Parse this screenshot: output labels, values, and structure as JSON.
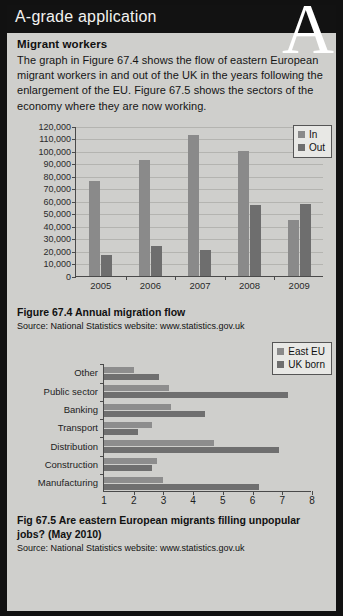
{
  "header": {
    "title": "A-grade application",
    "watermark": "A"
  },
  "article": {
    "subheading": "Migrant workers",
    "paragraph": "The graph in Figure 67.4 shows the flow of eastern European migrant workers in and out of the UK in the years following the enlargement of the EU. Figure 67.5 shows the sectors of the economy where they are now working."
  },
  "figure1": {
    "caption": "Figure 67.4  Annual migration flow",
    "source": "Source: National Statistics website: www.statistics.gov.uk"
  },
  "figure2": {
    "caption": "Fig 67.5  Are eastern European migrants filling unpopular jobs? (May 2010)",
    "source": "Source: National Statistics website: www.statistics.gov.uk"
  },
  "colors": {
    "series1": "#8a8a8a",
    "series2": "#6e6e6e",
    "page_bg": "#cfcfcc",
    "header_bg": "#121212",
    "axis": "#4a4a4a"
  },
  "chart_data": [
    {
      "type": "bar",
      "title": "Annual migration flow",
      "orientation": "vertical",
      "categories": [
        "2005",
        "2006",
        "2007",
        "2008",
        "2009"
      ],
      "series": [
        {
          "name": "In",
          "values": [
            76000,
            93000,
            113000,
            100000,
            45000
          ]
        },
        {
          "name": "Out",
          "values": [
            17000,
            24000,
            20500,
            57000,
            57500
          ]
        }
      ],
      "xlabel": "",
      "ylabel": "",
      "ylim": [
        0,
        120000
      ],
      "yticks": [
        0,
        10000,
        20000,
        30000,
        40000,
        50000,
        60000,
        70000,
        80000,
        90000,
        100000,
        110000,
        120000
      ],
      "ytick_labels": [
        "0",
        "10,000",
        "20,000",
        "30,000",
        "40,000",
        "50,000",
        "60,000",
        "70,000",
        "80,000",
        "90,000",
        "100,000",
        "110,000",
        "120,000"
      ],
      "grid": true,
      "legend_position": "top-right"
    },
    {
      "type": "bar",
      "title": "Are eastern European migrants filling unpopular jobs? (May 2010)",
      "orientation": "horizontal",
      "categories": [
        "Other",
        "Public sector",
        "Banking",
        "Transport",
        "Distribution",
        "Construction",
        "Manufacturing"
      ],
      "series": [
        {
          "name": "East EU",
          "values": [
            2.0,
            3.2,
            3.25,
            2.6,
            4.7,
            2.8,
            3.0
          ]
        },
        {
          "name": "UK born",
          "values": [
            2.85,
            7.2,
            4.4,
            2.15,
            6.9,
            2.6,
            6.2
          ]
        }
      ],
      "xlabel": "",
      "ylabel": "",
      "xlim": [
        1,
        8
      ],
      "xticks": [
        1,
        2,
        3,
        4,
        5,
        6,
        7,
        8
      ],
      "xtick_labels": [
        "1",
        "2",
        "3",
        "4",
        "5",
        "6",
        "7",
        "8"
      ],
      "grid": false,
      "legend_position": "top-right"
    }
  ]
}
